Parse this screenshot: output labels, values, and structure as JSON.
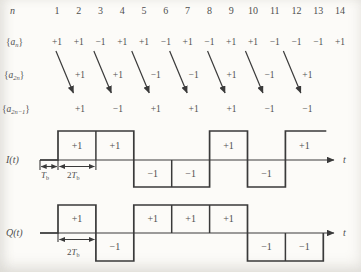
{
  "figure": {
    "background": "#fcfbf8",
    "ink": "#3a3a3a",
    "text_ink": "#555555"
  },
  "sequence_table": {
    "index_label": "n",
    "indices": [
      "1",
      "2",
      "3",
      "4",
      "5",
      "6",
      "7",
      "8",
      "9",
      "10",
      "11",
      "12",
      "13",
      "14"
    ],
    "rows": {
      "an": {
        "brace_open": "{",
        "base": "a",
        "sub": "n",
        "brace_close": "}",
        "values": [
          "+1",
          "+1",
          "−1",
          "+1",
          "+1",
          "−1",
          "+1",
          "−1",
          "+1",
          "+1",
          "−1",
          "−1",
          "−1",
          "+1"
        ]
      },
      "a2n": {
        "brace_open": "{",
        "base": "a",
        "sub": "2n",
        "brace_close": "}",
        "values": [
          "+1",
          "+1",
          "−1",
          "−1",
          "+1",
          "−1",
          "+1"
        ]
      },
      "a2n1": {
        "brace_open": "{",
        "base": "a",
        "sub": "2n−1",
        "brace_close": "}",
        "values": [
          "+1",
          "−1",
          "+1",
          "+1",
          "+1",
          "−1",
          "−1"
        ]
      }
    }
  },
  "waveforms": [
    {
      "id": "I",
      "label": "I(t)",
      "time_axis_label": "t",
      "values": [
        1,
        1,
        -1,
        -1,
        1,
        -1,
        1
      ],
      "value_labels": [
        "+1",
        "+1",
        "−1",
        "−1",
        "+1",
        "−1",
        "+1"
      ],
      "delay_marker": {
        "base": "T",
        "sub": "b"
      },
      "symbol_marker": {
        "prefix": "2",
        "base": "T",
        "sub": "b"
      },
      "end_style": "open"
    },
    {
      "id": "Q",
      "label": "Q(t)",
      "time_axis_label": "t",
      "values": [
        1,
        -1,
        1,
        1,
        1,
        -1,
        -1
      ],
      "value_labels": [
        "+1",
        "−1",
        "+1",
        "+1",
        "+1",
        "−1",
        "−1"
      ],
      "delay_marker": null,
      "symbol_marker": {
        "prefix": "2",
        "base": "T",
        "sub": "b"
      },
      "end_style": "closed"
    }
  ],
  "chart_data": [
    {
      "type": "line",
      "title": "I(t)",
      "step": true,
      "x_unit": "Tb",
      "x_edges": [
        1,
        3,
        5,
        7,
        9,
        11,
        13,
        15
      ],
      "values": [
        1,
        1,
        -1,
        -1,
        1,
        -1,
        1
      ],
      "ylim": [
        -1,
        1
      ],
      "xlabel": "t",
      "grid": false
    },
    {
      "type": "line",
      "title": "Q(t)",
      "step": true,
      "x_unit": "Tb",
      "x_edges": [
        1,
        3,
        5,
        7,
        9,
        11,
        13,
        15
      ],
      "values": [
        1,
        -1,
        1,
        1,
        1,
        -1,
        -1
      ],
      "ylim": [
        -1,
        1
      ],
      "xlabel": "t",
      "grid": false
    }
  ]
}
